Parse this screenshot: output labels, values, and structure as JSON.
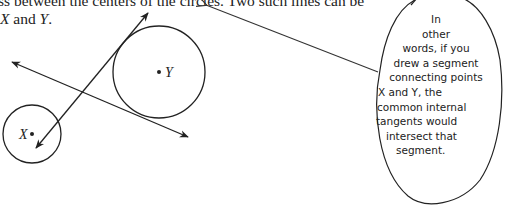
{
  "text": {
    "line1": "ss between the centers of the circles. Two such lines can be",
    "line2_var1": "X",
    "line2_mid": " and ",
    "line2_var2": "Y",
    "line2_end": "."
  },
  "figure": {
    "label_x": "X",
    "label_y": "Y"
  },
  "note": {
    "lines": [
      "In",
      "other",
      "words, if you",
      "drew a segment",
      "connecting points",
      "X and Y, the",
      "common internal",
      "tangents would",
      "intersect that",
      "segment."
    ]
  }
}
